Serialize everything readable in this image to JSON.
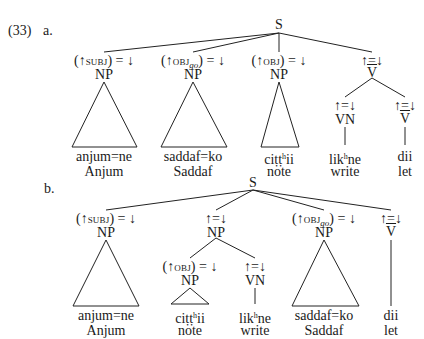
{
  "example": {
    "number": "(33)",
    "trees": [
      {
        "label": "a.",
        "root": "S",
        "children": [
          {
            "annotation": [
              "(↑",
              "subj",
              ") = ↓"
            ],
            "category": "NP",
            "terminal": "anjum=ne",
            "gloss": "Anjum",
            "shape": "triangle"
          },
          {
            "annotation": [
              "(↑",
              "obj",
              "go",
              ") = ↓"
            ],
            "category": "NP",
            "terminal": "saddaf=ko",
            "gloss": "Saddaf",
            "shape": "triangle"
          },
          {
            "annotation": [
              "(↑",
              "obj",
              ") = ↓"
            ],
            "category": "NP",
            "terminal": "ciṭṭʰii",
            "terminal_parts": [
              "ciṭṭ",
              "h",
              "ii"
            ],
            "gloss": "note",
            "shape": "triangle"
          },
          {
            "annotation": [
              "↑=↓"
            ],
            "category": "V",
            "category_bar": true,
            "children": [
              {
                "annotation": [
                  "↑=↓"
                ],
                "category": "VN",
                "terminal_parts": [
                  "lik",
                  "h",
                  "ne"
                ],
                "gloss": "write"
              },
              {
                "annotation": [
                  "↑=↓"
                ],
                "category": "V",
                "category_bar": true,
                "terminal": "dii",
                "gloss": "let"
              }
            ]
          }
        ]
      },
      {
        "label": "b.",
        "root": "S",
        "children": [
          {
            "annotation": [
              "(↑",
              "subj",
              ") = ↓"
            ],
            "category": "NP",
            "terminal": "anjum=ne",
            "gloss": "Anjum",
            "shape": "triangle"
          },
          {
            "annotation": [
              "↑=↓"
            ],
            "category": "NP",
            "children": [
              {
                "annotation": [
                  "(↑",
                  "obj",
                  ") = ↓"
                ],
                "category": "NP",
                "terminal_parts": [
                  "ciṭṭ",
                  "h",
                  "ii"
                ],
                "gloss": "note",
                "shape": "triangle"
              },
              {
                "annotation": [
                  "↑=↓"
                ],
                "category": "VN",
                "terminal_parts": [
                  "lik",
                  "h",
                  "ne"
                ],
                "gloss": "write"
              }
            ]
          },
          {
            "annotation": [
              "(↑",
              "obj",
              "go",
              ") = ↓"
            ],
            "category": "NP",
            "terminal": "saddaf=ko",
            "gloss": "Saddaf",
            "shape": "triangle"
          },
          {
            "annotation": [
              "↑=↓"
            ],
            "category": "V",
            "category_bar": true,
            "terminal": "dii",
            "gloss": "let"
          }
        ]
      }
    ]
  },
  "colors": {
    "ink": "#1a1a1a",
    "background": "#ffffff"
  }
}
